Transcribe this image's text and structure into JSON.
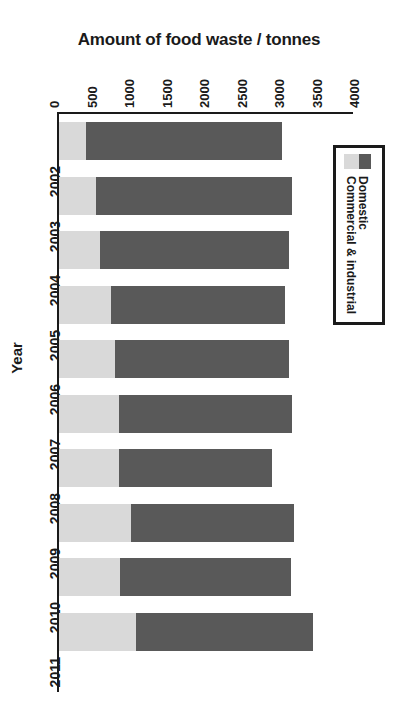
{
  "chart_data": {
    "type": "bar",
    "orientation": "horizontal",
    "stacked": true,
    "title": "",
    "xlabel": "Amount of food waste / tonnes",
    "ylabel": "Year",
    "categories": [
      "2002",
      "2003",
      "2004",
      "2005",
      "2006",
      "2007",
      "2008",
      "2009",
      "2010",
      "2011"
    ],
    "xlim": [
      0,
      4000
    ],
    "xticks": [
      0,
      500,
      1000,
      1500,
      2000,
      2500,
      3000,
      3500,
      4000
    ],
    "xtick_labels": [
      "0",
      "500",
      "1000",
      "1500",
      "2000",
      "2500",
      "3000",
      "3500",
      "4000"
    ],
    "grid": false,
    "legend_position": "right",
    "series": [
      {
        "name": "Commercial & industrial",
        "color": "#d9d9d9",
        "values": [
          360,
          490,
          550,
          690,
          750,
          800,
          800,
          960,
          810,
          1030
        ]
      },
      {
        "name": "Domestic",
        "color": "#595959",
        "values": [
          2610,
          2610,
          2520,
          2320,
          2320,
          2310,
          2040,
          2170,
          2280,
          2360
        ]
      }
    ],
    "totals": [
      2970,
      3100,
      3070,
      3010,
      3070,
      3110,
      2840,
      3130,
      3090,
      3390
    ]
  },
  "axes": {
    "value_axis_title": "Amount of food waste / tonnes",
    "category_axis_title": "Year"
  },
  "legend": {
    "entries": [
      {
        "label": "Domestic",
        "color": "#595959"
      },
      {
        "label": "Commercial & industrial",
        "color": "#d9d9d9"
      }
    ]
  },
  "colors": {
    "domestic": "#595959",
    "commercial_industrial": "#d9d9d9",
    "axis": "#1a1a1a",
    "background": "#ffffff"
  }
}
